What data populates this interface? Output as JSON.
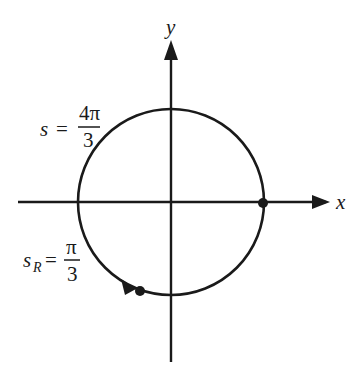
{
  "diagram": {
    "type": "unit-circle-arc",
    "axes": {
      "x_label": "x",
      "y_label": "y"
    },
    "circle": {
      "center": [
        171,
        202
      ],
      "radius": 93
    },
    "points": [
      {
        "name": "start-point",
        "description": "point on positive x-axis"
      },
      {
        "name": "end-point",
        "description": "terminal point of arc in third/fourth quadrant"
      }
    ],
    "labels": {
      "s": {
        "variable": "s",
        "equals": "=",
        "numerator": "4π",
        "denominator": "3"
      },
      "s_r": {
        "variable": "s",
        "subscript": "R",
        "equals": "=",
        "numerator": "π",
        "denominator": "3"
      }
    },
    "colors": {
      "stroke": "#1a1a1a",
      "background": "#ffffff"
    }
  }
}
